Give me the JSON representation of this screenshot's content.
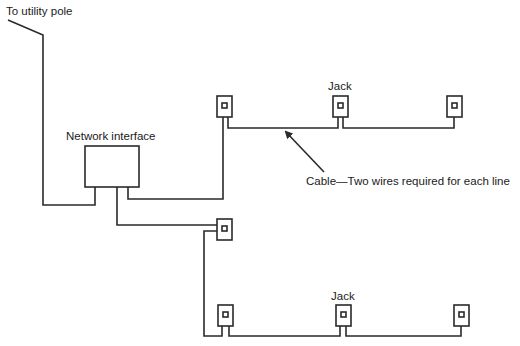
{
  "diagram": {
    "labels": {
      "utility_pole": "To utility pole",
      "network_interface": "Network interface",
      "jack_top": "Jack",
      "jack_bottom": "Jack",
      "cable": "Cable—Two wires required for each line"
    },
    "colors": {
      "line": "#2a2a2a",
      "background": "#ffffff"
    },
    "jacks": [
      {
        "id": "top-1",
        "x": 217,
        "y": 96
      },
      {
        "id": "top-2",
        "x": 333,
        "y": 96
      },
      {
        "id": "top-3",
        "x": 447,
        "y": 96
      },
      {
        "id": "middle",
        "x": 217,
        "y": 219
      },
      {
        "id": "bottom-1",
        "x": 218,
        "y": 305
      },
      {
        "id": "bottom-2",
        "x": 336,
        "y": 305
      },
      {
        "id": "bottom-3",
        "x": 454,
        "y": 305
      }
    ]
  }
}
